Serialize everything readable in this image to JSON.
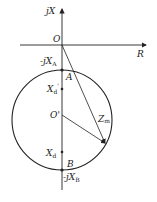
{
  "diagram": {
    "type": "impedance-circle",
    "axes": {
      "vertical_label": "jX",
      "horizontal_label": "R",
      "origin_label": "O"
    },
    "points": {
      "A": {
        "label": "A",
        "value_label": "-jX",
        "value_sub": "A"
      },
      "B": {
        "label": "B",
        "value_label": "-jX",
        "value_sub": "B"
      },
      "Xd_prime": {
        "label": "X",
        "sub": "d",
        "prime": "'"
      },
      "Xd": {
        "label": "X",
        "sub": "d"
      },
      "center": {
        "label": "O'"
      }
    },
    "vector_label": {
      "main": "Z",
      "sub": "m"
    },
    "colors": {
      "line": "#222222",
      "background": "#ffffff"
    }
  }
}
